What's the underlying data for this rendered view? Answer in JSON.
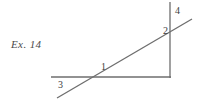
{
  "figure": {
    "caption": "Ex. 14",
    "background_color": "#ffffff",
    "line_color": "#6e6e6e",
    "label_color": "#3d3d3d",
    "width": 199,
    "height": 104
  },
  "labels": {
    "angle1": "1",
    "angle2": "2",
    "angle3": "3",
    "angle4": "4"
  },
  "geometry": {
    "horizontal_ray": {
      "x1": 51,
      "y1": 77,
      "x2": 171,
      "y2": 77
    },
    "vertical_line": {
      "x1": 170,
      "y1": 2,
      "x2": 170,
      "y2": 78
    },
    "transversal": {
      "x1": 57,
      "y1": 98,
      "x2": 192,
      "y2": 19
    }
  }
}
